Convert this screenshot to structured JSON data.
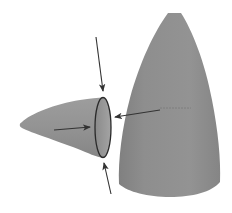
{
  "diagram": {
    "colors": {
      "background": "#ffffff",
      "cone_fill": "#8f8f8f",
      "cone_fill_light": "#a3a3a3",
      "cone_fill_dark": "#7c7c7c",
      "rim_inner": "#9a9a9a",
      "rim_stroke": "#2a2a2a",
      "arrow": "#333333",
      "seam": "#6e6e6e"
    },
    "shapes": [
      {
        "id": "large-cone",
        "type": "cone",
        "tip": [
          174,
          13
        ],
        "base_left": 119,
        "base_right": 220,
        "base_y": 197
      },
      {
        "id": "small-cone",
        "type": "cone",
        "tip": [
          21,
          124
        ],
        "rim_center": [
          103,
          127
        ],
        "rim_rx": 8,
        "rim_ry": 30
      }
    ],
    "arrows": [
      {
        "id": "arrow-top",
        "from": [
          96,
          37
        ],
        "to": [
          103,
          91
        ]
      },
      {
        "id": "arrow-bottom",
        "from": [
          111,
          194
        ],
        "to": [
          104,
          163
        ]
      },
      {
        "id": "arrow-right",
        "from": [
          160,
          110
        ],
        "to": [
          115,
          117
        ]
      },
      {
        "id": "arrow-inside",
        "from": [
          54,
          130
        ],
        "to": [
          90,
          127
        ]
      }
    ]
  }
}
